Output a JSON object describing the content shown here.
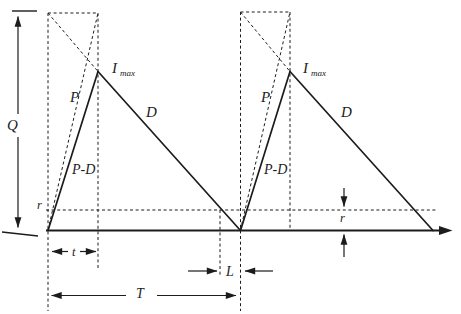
{
  "colors": {
    "ink": "#1c1c1c",
    "paper": "#ffffff"
  },
  "axis": {
    "quantity_label": "Q"
  },
  "cycles": [
    {
      "production_label": "P",
      "net_buildup_label": "P-D",
      "demand_label": "D",
      "max_inventory_base": "I",
      "max_inventory_sub": "max"
    },
    {
      "production_label": "P",
      "net_buildup_label": "P-D",
      "demand_label": "D",
      "max_inventory_base": "I",
      "max_inventory_sub": "max"
    }
  ],
  "dimensions": {
    "production_time_label": "t",
    "cycle_length_label": "T",
    "lead_time_label": "L",
    "reorder_level_left_label": "r",
    "reorder_level_right_label": "r"
  }
}
